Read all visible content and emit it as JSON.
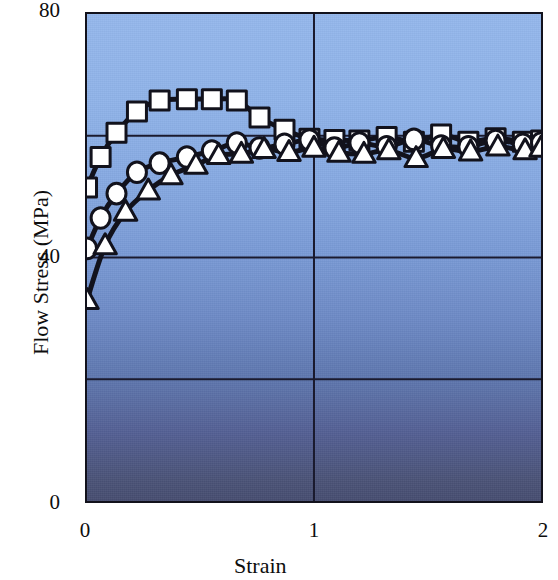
{
  "chart_data": {
    "type": "line",
    "title": "",
    "xlabel": "Strain",
    "ylabel": "Flow Stress (MPa)",
    "xlim": [
      0,
      2
    ],
    "ylim": [
      0,
      80
    ],
    "xticks": [
      "0",
      "1",
      "2"
    ],
    "yticks": [
      "0",
      "40",
      "80"
    ],
    "xtick_values": [
      0,
      1,
      2
    ],
    "ytick_values": [
      0,
      40,
      80
    ],
    "grid": "major gridlines at y = 20, 40, 60 and x = 1",
    "legend": "none",
    "background": "vertical blue gradient, light blue at top to dark slate blue at bottom",
    "series": [
      {
        "name": "Series 1 (squares)",
        "marker": "square",
        "points": [
          [
            0.0,
            51.5
          ],
          [
            0.06,
            56.5
          ],
          [
            0.13,
            60.5
          ],
          [
            0.22,
            64.0
          ],
          [
            0.32,
            65.8
          ],
          [
            0.44,
            66.0
          ],
          [
            0.55,
            66.0
          ],
          [
            0.66,
            65.8
          ],
          [
            0.76,
            63.0
          ],
          [
            0.87,
            61.0
          ],
          [
            0.98,
            59.5
          ],
          [
            1.09,
            59.3
          ],
          [
            1.2,
            59.2
          ],
          [
            1.32,
            59.8
          ],
          [
            1.44,
            59.0
          ],
          [
            1.56,
            60.2
          ],
          [
            1.68,
            59.0
          ],
          [
            1.8,
            59.6
          ],
          [
            1.92,
            59.0
          ],
          [
            2.0,
            59.2
          ]
        ]
      },
      {
        "name": "Series 2 (circles)",
        "marker": "circle",
        "points": [
          [
            0.0,
            41.5
          ],
          [
            0.06,
            46.5
          ],
          [
            0.13,
            50.5
          ],
          [
            0.22,
            54.0
          ],
          [
            0.32,
            55.5
          ],
          [
            0.44,
            56.5
          ],
          [
            0.55,
            57.5
          ],
          [
            0.66,
            58.8
          ],
          [
            0.76,
            58.0
          ],
          [
            0.87,
            58.6
          ],
          [
            0.98,
            59.3
          ],
          [
            1.09,
            58.0
          ],
          [
            1.2,
            58.8
          ],
          [
            1.32,
            58.2
          ],
          [
            1.44,
            59.4
          ],
          [
            1.56,
            58.3
          ],
          [
            1.68,
            58.2
          ],
          [
            1.8,
            59.2
          ],
          [
            1.92,
            58.6
          ],
          [
            2.0,
            58.8
          ]
        ]
      },
      {
        "name": "Series 3 (triangles)",
        "marker": "triangle",
        "points": [
          [
            0.0,
            33.0
          ],
          [
            0.08,
            42.0
          ],
          [
            0.17,
            47.5
          ],
          [
            0.27,
            51.0
          ],
          [
            0.37,
            53.5
          ],
          [
            0.48,
            55.2
          ],
          [
            0.58,
            56.8
          ],
          [
            0.68,
            57.0
          ],
          [
            0.78,
            57.8
          ],
          [
            0.89,
            57.3
          ],
          [
            1.0,
            58.0
          ],
          [
            1.11,
            57.2
          ],
          [
            1.22,
            57.0
          ],
          [
            1.33,
            57.6
          ],
          [
            1.45,
            56.3
          ],
          [
            1.57,
            57.8
          ],
          [
            1.69,
            57.4
          ],
          [
            1.81,
            58.2
          ],
          [
            1.93,
            57.6
          ],
          [
            2.0,
            58.0
          ]
        ]
      }
    ]
  },
  "colors": {
    "axis": "#12121c",
    "curve": "#12121c",
    "marker_fill": "#ffffff",
    "marker_stroke": "#12121c",
    "grid": "#1a1a2e",
    "bg_top": "#94b7ec",
    "bg_bottom": "#464d70"
  }
}
